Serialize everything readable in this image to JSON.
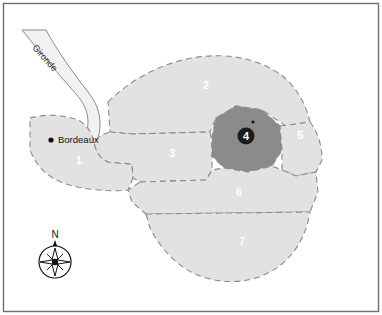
{
  "map": {
    "frame_color": "#6f6f6f",
    "background_color": "#ffffff",
    "boundary_color": "#8a8a8a",
    "region_fill_light": "#e2e2e2",
    "region_fill_mid": "#d6d6d6",
    "region_fill_dark": "#8b8b8b",
    "river_fill": "#f2f2f2",
    "label_color": "#ffffff",
    "city": {
      "name": "Bordeaux",
      "marker": "city-dot"
    },
    "river": {
      "name": "Gironde"
    },
    "compass": {
      "north_label": "N",
      "icon": "compass-rose-icon"
    },
    "regions": [
      {
        "id": "1",
        "label": "1",
        "tone": "light"
      },
      {
        "id": "2",
        "label": "2",
        "tone": "light"
      },
      {
        "id": "3",
        "label": "3",
        "tone": "light"
      },
      {
        "id": "4",
        "label": "4",
        "tone": "dark"
      },
      {
        "id": "5",
        "label": "5",
        "tone": "light"
      },
      {
        "id": "6",
        "label": "6",
        "tone": "light"
      },
      {
        "id": "7",
        "label": "7",
        "tone": "light"
      }
    ]
  }
}
